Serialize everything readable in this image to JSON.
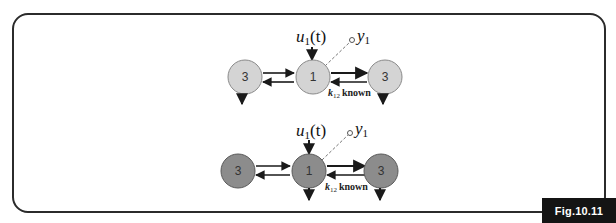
{
  "figure": {
    "label": "Fig.10.11",
    "colors": {
      "frame": "#2b2b2b",
      "label_bg": "#141414",
      "label_text": "#ffffff",
      "top_node_fill": "#d4d4d4",
      "bottom_node_fill": "#8c8c8c",
      "arrow": "#1a1a1a"
    }
  },
  "diagrams": [
    {
      "id": "top",
      "input_label": "u",
      "input_sub": "1",
      "input_arg": "(t)",
      "output_label": "y",
      "output_sub": "1",
      "nodes": [
        {
          "id": "left",
          "label": "3"
        },
        {
          "id": "center",
          "label": "1"
        },
        {
          "id": "right",
          "label": "3"
        }
      ],
      "edge_annotation": {
        "k": "k",
        "sub": "12",
        "text": "known"
      }
    },
    {
      "id": "bottom",
      "input_label": "u",
      "input_sub": "1",
      "input_arg": "(t)",
      "output_label": "y",
      "output_sub": "1",
      "nodes": [
        {
          "id": "left",
          "label": "3"
        },
        {
          "id": "center",
          "label": "1"
        },
        {
          "id": "right",
          "label": "3"
        }
      ],
      "edge_annotation": {
        "k": "k",
        "sub": "12",
        "text": "known"
      }
    }
  ]
}
